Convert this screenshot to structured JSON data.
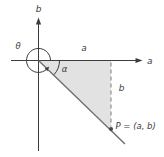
{
  "figure": {
    "labels": {
      "theta": "θ",
      "alpha": "α",
      "axis_a": "a",
      "axis_b": "b",
      "segment_a": "a",
      "segment_b": "b",
      "point_p": "P = (a, b)"
    },
    "colors": {
      "axis": "#3c3c3c",
      "hypotenuse": "#6e6e6e",
      "arc": "#3c3c3c",
      "triangle_fill": "#e2e2e2",
      "dash": "#909090",
      "text": "#3c3c3c",
      "point": "#4a4a4a",
      "background": "#ffffff"
    }
  }
}
